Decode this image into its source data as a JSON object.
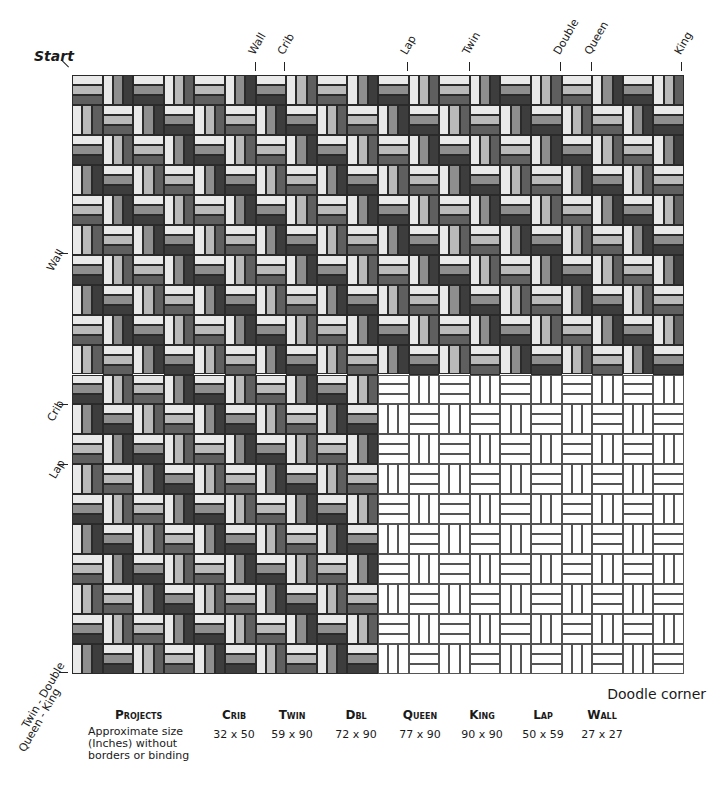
{
  "labels": {
    "start": "Start",
    "doodle_corner": "Doodle corner",
    "top_markers": [
      {
        "text": "Wall",
        "x": 255
      },
      {
        "text": "Crib",
        "x": 284
      },
      {
        "text": "Lap",
        "x": 407
      },
      {
        "text": "Twin",
        "x": 469
      },
      {
        "text": "Double",
        "x": 560
      },
      {
        "text": "Queen",
        "x": 591
      },
      {
        "text": "King",
        "x": 681
      }
    ],
    "left_markers": [
      {
        "text": "Wall",
        "y": 253
      },
      {
        "text": "Crib",
        "y": 404
      },
      {
        "text": "Lap",
        "y": 464
      },
      {
        "text": "Twin - Double",
        "y": 672
      },
      {
        "text": "Queen - King",
        "y": 684
      }
    ]
  },
  "table": {
    "row_header": "Projects",
    "row_desc": [
      "Approximate size",
      "(Inches) without",
      "borders or binding"
    ],
    "columns": [
      {
        "name": "Crib",
        "size": "32 x 50"
      },
      {
        "name": "Twin",
        "size": "59 x 90"
      },
      {
        "name": "Dbl",
        "size": "72 x 90"
      },
      {
        "name": "Queen",
        "size": "77 x 90"
      },
      {
        "name": "King",
        "size": "90 x 90"
      },
      {
        "name": "Lap",
        "size": "50 x 59"
      },
      {
        "name": "Wall",
        "size": "27 x 27"
      }
    ]
  },
  "quilt": {
    "cols": 20,
    "rows": 20,
    "blank_from_col": 10,
    "blank_from_row": 10,
    "palette_a": [
      "#e9e9e9",
      "#b9b9b9",
      "#5f5f5f"
    ],
    "palette_b": [
      "#e9e9e9",
      "#8e8e8e",
      "#3d3d3d"
    ],
    "blank": [
      "#ffffff",
      "#ffffff",
      "#ffffff"
    ]
  }
}
